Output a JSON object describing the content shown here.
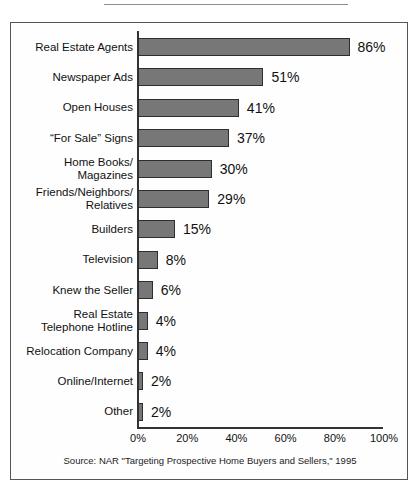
{
  "figure": {
    "source_note": "Source: NAR \"Targeting Prospective Home Buyers and Sellers,\" 1995"
  },
  "chart_data": {
    "type": "bar",
    "orientation": "horizontal",
    "title": "",
    "xlabel": "",
    "ylabel": "",
    "xlim": [
      0,
      100
    ],
    "xticks": [
      "0%",
      "20%",
      "40%",
      "60%",
      "80%",
      "100%"
    ],
    "xtick_values": [
      0,
      20,
      40,
      60,
      80,
      100
    ],
    "grid": false,
    "legend": false,
    "bar_color": "#777777",
    "bar_edge_color": "#2e2e2e",
    "value_suffix": "%",
    "categories": [
      "Real Estate Agents",
      "Newspaper Ads",
      "Open Houses",
      "“For Sale” Signs",
      "Home Books/ Magazines",
      "Friends/Neighbors/ Relatives",
      "Builders",
      "Television",
      "Knew the Seller",
      "Real Estate Telephone Hotline",
      "Relocation Company",
      "Online/Internet",
      "Other"
    ],
    "values": [
      86,
      51,
      41,
      37,
      30,
      29,
      15,
      8,
      6,
      4,
      4,
      2,
      2
    ],
    "value_labels": [
      "86%",
      "51%",
      "41%",
      "37%",
      "30%",
      "29%",
      "15%",
      "8%",
      "6%",
      "4%",
      "4%",
      "2%",
      "2%"
    ],
    "bars": [
      {
        "label_lines": [
          "Real Estate Agents"
        ],
        "value": 86,
        "value_label": "86%"
      },
      {
        "label_lines": [
          "Newspaper Ads"
        ],
        "value": 51,
        "value_label": "51%"
      },
      {
        "label_lines": [
          "Open Houses"
        ],
        "value": 41,
        "value_label": "41%"
      },
      {
        "label_lines": [
          "“For Sale” Signs"
        ],
        "value": 37,
        "value_label": "37%"
      },
      {
        "label_lines": [
          "Home Books/",
          "Magazines"
        ],
        "value": 30,
        "value_label": "30%"
      },
      {
        "label_lines": [
          "Friends/Neighbors/",
          "Relatives"
        ],
        "value": 29,
        "value_label": "29%"
      },
      {
        "label_lines": [
          "Builders"
        ],
        "value": 15,
        "value_label": "15%"
      },
      {
        "label_lines": [
          "Television"
        ],
        "value": 8,
        "value_label": "8%"
      },
      {
        "label_lines": [
          "Knew the Seller"
        ],
        "value": 6,
        "value_label": "6%"
      },
      {
        "label_lines": [
          "Real Estate",
          "Telephone Hotline"
        ],
        "value": 4,
        "value_label": "4%"
      },
      {
        "label_lines": [
          "Relocation Company"
        ],
        "value": 4,
        "value_label": "4%"
      },
      {
        "label_lines": [
          "Online/Internet"
        ],
        "value": 2,
        "value_label": "2%"
      },
      {
        "label_lines": [
          "Other"
        ],
        "value": 2,
        "value_label": "2%"
      }
    ]
  }
}
